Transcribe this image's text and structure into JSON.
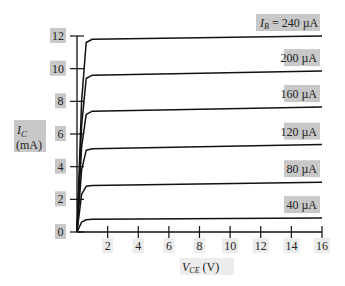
{
  "chart_data": {
    "type": "line",
    "title": "",
    "xlabel": "V_CE (V)",
    "ylabel": "I_C (mA)",
    "xlim": [
      0,
      16
    ],
    "ylim": [
      0,
      12
    ],
    "x_ticks": [
      2,
      4,
      6,
      8,
      10,
      12,
      14,
      16
    ],
    "y_ticks": [
      0,
      2,
      4,
      6,
      8,
      10,
      12
    ],
    "grid": false,
    "legend_position": "inline-right",
    "series": [
      {
        "name": "I_B = 240 µA",
        "label": "I_B = 240 µA",
        "x": [
          0,
          0.3,
          0.6,
          1,
          16
        ],
        "values": [
          0,
          8,
          11.6,
          11.8,
          12.0
        ]
      },
      {
        "name": "200 µA",
        "label": "200 µA",
        "x": [
          0,
          0.3,
          0.6,
          1,
          16
        ],
        "values": [
          0,
          6.5,
          9.4,
          9.6,
          9.85
        ]
      },
      {
        "name": "160 µA",
        "label": "160 µA",
        "x": [
          0,
          0.3,
          0.6,
          1,
          16
        ],
        "values": [
          0,
          5.2,
          7.2,
          7.4,
          7.65
        ]
      },
      {
        "name": "120 µA",
        "label": "120 µA",
        "x": [
          0,
          0.3,
          0.6,
          1,
          16
        ],
        "values": [
          0,
          3.8,
          5.0,
          5.1,
          5.35
        ]
      },
      {
        "name": "80 µA",
        "label": "80 µA",
        "x": [
          0,
          0.3,
          0.6,
          1,
          16
        ],
        "values": [
          0,
          2.3,
          2.8,
          2.85,
          3.05
        ]
      },
      {
        "name": "40 µA",
        "label": "40 µA",
        "x": [
          0,
          0.3,
          0.6,
          1,
          16
        ],
        "values": [
          0,
          0.6,
          0.75,
          0.78,
          0.85
        ]
      }
    ]
  },
  "labels": {
    "ylabel_line1": "I",
    "ylabel_sub": "C",
    "ylabel_line2": "(mA)",
    "xlabel_main": "V",
    "xlabel_sub": "CE",
    "xlabel_unit": " (V)",
    "ib_prefix": "I",
    "ib_sub": "B",
    "ib_eq": " = 240 µA"
  }
}
